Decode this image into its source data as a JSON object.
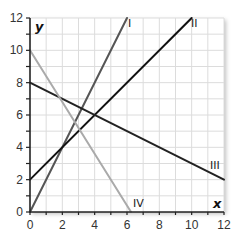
{
  "chart_data": {
    "type": "line",
    "title": "",
    "xlabel": "x",
    "ylabel": "y",
    "xlim": [
      0,
      12
    ],
    "ylim": [
      0,
      12
    ],
    "grid": true,
    "grid_step": 1,
    "x_ticks": [
      0,
      2,
      4,
      6,
      8,
      10,
      12
    ],
    "y_ticks": [
      0,
      2,
      4,
      6,
      8,
      10,
      12
    ],
    "legend": "inline labels at line ends",
    "series": [
      {
        "name": "I",
        "color": "#555555",
        "points": [
          [
            0,
            0
          ],
          [
            6,
            12
          ]
        ]
      },
      {
        "name": "II",
        "color": "#111111",
        "points": [
          [
            0,
            2
          ],
          [
            10,
            12
          ]
        ]
      },
      {
        "name": "III",
        "color": "#222222",
        "points": [
          [
            0,
            8
          ],
          [
            12,
            2
          ]
        ]
      },
      {
        "name": "IV",
        "color": "#aaaaaa",
        "points": [
          [
            0,
            10
          ],
          [
            6.25,
            0
          ]
        ]
      }
    ]
  },
  "axis": {
    "x_name": "x",
    "y_name": "y",
    "x_tick_labels": [
      "0",
      "2",
      "4",
      "6",
      "8",
      "10",
      "12"
    ],
    "y_tick_labels": [
      "0",
      "2",
      "4",
      "6",
      "8",
      "10",
      "12"
    ]
  },
  "labels": {
    "I": "I",
    "II": "II",
    "III": "III",
    "IV": "IV"
  }
}
